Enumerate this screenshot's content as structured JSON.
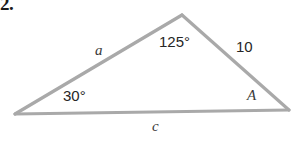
{
  "figure": {
    "problem_number": "2.",
    "type": "triangle-diagram",
    "stroke_color": "#a9a9a9",
    "text_color": "#262626",
    "background_color": "#ffffff",
    "vertices": {
      "left": {
        "x": 15,
        "y": 114
      },
      "apex": {
        "x": 182,
        "y": 15
      },
      "right": {
        "x": 289,
        "y": 110
      }
    },
    "labels": {
      "angle_apex": "125°",
      "angle_left": "30°",
      "angle_right": "A",
      "side_right": "10",
      "side_left": "a",
      "side_bottom": "c"
    }
  }
}
